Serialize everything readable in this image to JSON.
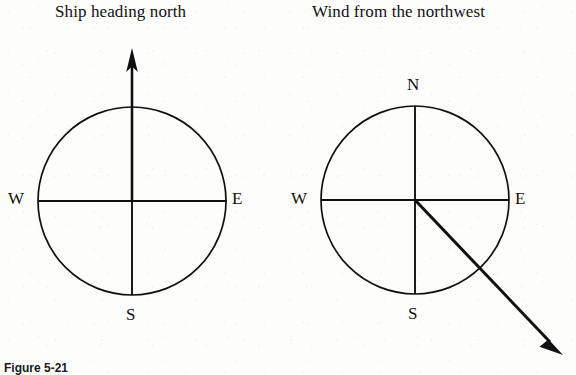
{
  "figure": {
    "caption": "Figure 5-21",
    "background_color": "#fdfdfc",
    "ink_color": "#111111",
    "width": 576,
    "height": 375
  },
  "panels": [
    {
      "id": "ship-heading",
      "title": "Ship heading north",
      "title_x": 55,
      "title_y": 2,
      "compass": {
        "center_x": 132,
        "center_y": 201,
        "radius": 94,
        "labels": {
          "north": "",
          "east": "E",
          "south": "S",
          "west": "W"
        },
        "label_positions": {
          "east": {
            "x": 232,
            "y": 191
          },
          "south": {
            "x": 127,
            "y": 307
          },
          "west": {
            "x": 8,
            "y": 191
          }
        }
      },
      "vector": {
        "name": "ship-heading-vector",
        "description": "arrow pointing north",
        "from_x": 132,
        "from_y": 201,
        "to_x": 132,
        "to_y": 49,
        "stroke_width": 2.6,
        "head_length": 22,
        "head_width": 11
      }
    },
    {
      "id": "wind-direction",
      "title": "Wind from the northwest",
      "title_x": 312,
      "title_y": 2,
      "compass": {
        "center_x": 415,
        "center_y": 200,
        "radius": 94,
        "labels": {
          "north": "N",
          "east": "E",
          "south": "S",
          "west": "W"
        },
        "label_positions": {
          "north": {
            "x": 408,
            "y": 78
          },
          "east": {
            "x": 515,
            "y": 190
          },
          "south": {
            "x": 409,
            "y": 306
          },
          "west": {
            "x": 291,
            "y": 190
          }
        }
      },
      "vector": {
        "name": "wind-direction-vector",
        "description": "arrow from center toward southeast",
        "from_x": 415,
        "from_y": 200,
        "to_x": 562,
        "to_y": 354,
        "stroke_width": 3.0,
        "head_length": 24,
        "head_width": 12
      }
    }
  ]
}
